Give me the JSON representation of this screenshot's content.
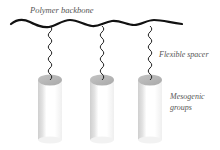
{
  "diagram": {
    "labels": {
      "backbone": "Polymer backbone",
      "spacer": "Flexible spacer",
      "mesogen_line1": "Mesogenic",
      "mesogen_line2": "groups"
    },
    "side_chain_count": 3,
    "colors": {
      "backbone": "#111111",
      "spacer": "#222222",
      "label": "#555555",
      "cylinder_top": "#b8b8b8",
      "cylinder_body_light": "#ffffff",
      "cylinder_body_dark": "#c8c8c8"
    }
  }
}
